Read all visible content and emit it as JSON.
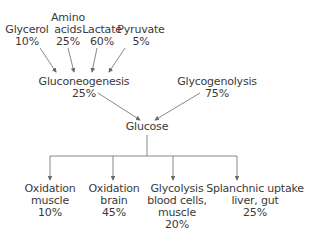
{
  "sources": [
    {
      "name": "Glycerol",
      "percent": "10%"
    },
    {
      "name_line1": "Amino",
      "name_line2": "acids",
      "percent": "25%"
    },
    {
      "name": "Lactate",
      "percent": "60%"
    },
    {
      "name": "Pyruvate",
      "percent": "5%"
    }
  ],
  "gluconeogenesis": {
    "label": "Gluconeogenesis",
    "percent": "25%"
  },
  "glycogenolysis": {
    "label": "Glycogenolysis",
    "percent": "75%"
  },
  "glucose": {
    "label": "Glucose"
  },
  "fates": [
    {
      "line1": "Oxidation",
      "line2": "muscle",
      "percent": "10%"
    },
    {
      "line1": "Oxidation",
      "line2": "brain",
      "percent": "45%"
    },
    {
      "line1": "Glycolysis",
      "line2": "blood cells,",
      "line3": "muscle",
      "percent": "20%"
    },
    {
      "line1": "Splanchnic uptake",
      "line2": "liver, gut",
      "percent": "25%"
    }
  ],
  "colors": {
    "text": "#3a3a3a",
    "lines": "#6a6a6a"
  }
}
